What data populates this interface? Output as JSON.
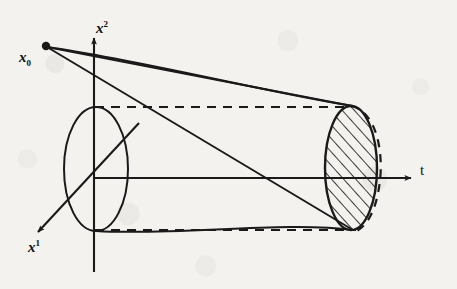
{
  "figure": {
    "kind": "line-diagram",
    "caption_text": "",
    "background_color": "#f3f2ee",
    "ink_color": "#1a1a1a",
    "labels": {
      "source_point": {
        "text_base": "x",
        "text_sub": "0",
        "name": "x-nought"
      },
      "vertical_axis": {
        "text_base": "x",
        "text_sup": "2",
        "name": "x-squared-axis"
      },
      "diagonal_axis": {
        "text_base": "x",
        "text_sup": "1",
        "name": "x-one-axis"
      },
      "horizontal_axis": {
        "text_base": "t",
        "name": "t-axis"
      }
    },
    "elements": [
      {
        "name": "source-dot",
        "type": "point",
        "x": 46,
        "y": 46
      },
      {
        "name": "origin-ellipse",
        "type": "ellipse",
        "cx": 96,
        "cy": 169,
        "rx": 32,
        "ry": 62,
        "fill": "none"
      },
      {
        "name": "end-ellipse-hatched",
        "type": "ellipse",
        "cx": 353,
        "cy": 168,
        "rx": 27,
        "ry": 63,
        "fill": "hatch"
      },
      {
        "name": "end-ellipse-dashed-arc",
        "type": "arc",
        "dashed": true
      },
      {
        "name": "cone-upper-curve",
        "type": "curve"
      },
      {
        "name": "cone-lower-curve",
        "type": "curve"
      },
      {
        "name": "ray-upper",
        "type": "line"
      },
      {
        "name": "ray-lower",
        "type": "line"
      },
      {
        "name": "dashed-top-connector",
        "type": "line",
        "dashed": true
      },
      {
        "name": "dashed-bottom-connector",
        "type": "line",
        "dashed": true
      }
    ]
  }
}
